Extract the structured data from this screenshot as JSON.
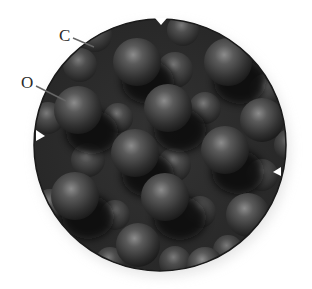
{
  "diagram": {
    "type": "space-filling crystal lattice model (magnified circular view)",
    "labels": [
      {
        "id": "C",
        "text": "C",
        "points_to": "carbon atom"
      },
      {
        "id": "O",
        "text": "O",
        "points_to": "oxygen atom"
      }
    ],
    "colors": {
      "background": "#ffffff",
      "lens_fill": "#2b2b2b",
      "sphere_highlight": "#8a8a8a",
      "sphere_base": "#3a3a3a",
      "shadow": "#0e0e0e",
      "label_text": "#2a2a2a",
      "leader_line": "#555555",
      "marker": "#ffffff"
    },
    "lens": {
      "cx": 160,
      "cy": 145,
      "r": 126
    },
    "markers": [
      {
        "position": "top",
        "direction": "down"
      },
      {
        "position": "left",
        "direction": "right"
      },
      {
        "position": "right",
        "direction": "left"
      }
    ]
  }
}
